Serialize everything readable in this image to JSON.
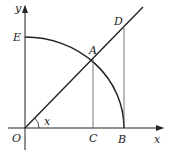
{
  "diagram": {
    "type": "geometry",
    "axes": {
      "x_label": "x",
      "y_label": "y",
      "origin_label": "O"
    },
    "points": {
      "O": {
        "label": "O"
      },
      "A": {
        "label": "A"
      },
      "B": {
        "label": "B"
      },
      "C": {
        "label": "C"
      },
      "D": {
        "label": "D"
      },
      "E": {
        "label": "E"
      }
    },
    "angle_label": "x",
    "colors": {
      "stroke": "#222222",
      "thin_stroke": "#555555",
      "background": "#ffffff"
    }
  }
}
